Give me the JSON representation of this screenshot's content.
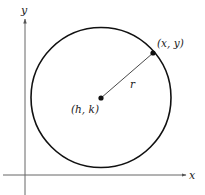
{
  "diagram": {
    "type": "circle-standard-form",
    "axes": {
      "x_label": "x",
      "y_label": "y",
      "color": "#555555"
    },
    "circle": {
      "center_label": "(h, k)",
      "point_label": "(x, y)",
      "radius_label": "r",
      "stroke_color": "#111111"
    }
  }
}
